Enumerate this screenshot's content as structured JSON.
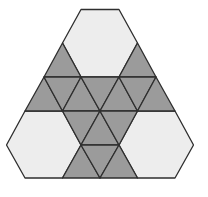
{
  "figure": {
    "colors": {
      "background": "#ffffff",
      "light_fill": "#ededed",
      "dark_fill": "#9b9b9b",
      "stroke": "#2e2e2e"
    },
    "stroke_width": 1.3,
    "hexagons": [
      {
        "name": "top-hexagon",
        "points": "81,9.5 119,9.5 137.5,43 119,77 81,77 62.5,43"
      },
      {
        "name": "left-hexagon",
        "points": "25,111 62.5,111 81,145 62.5,178 25,178 6.5,145"
      },
      {
        "name": "right-hexagon",
        "points": "137.5,111 175,111 193.5,145 175,178 137.5,178 119,145"
      }
    ],
    "triangles": [
      {
        "name": "triangle-top-left",
        "points": "62.5,43 81,77 44,77"
      },
      {
        "name": "triangle-top-right",
        "points": "137.5,43 156,77 119,77"
      },
      {
        "name": "triangle-r2-1",
        "points": "44,77 62.5,111 25,111"
      },
      {
        "name": "triangle-r2-2",
        "points": "44,77 81,77 62.5,111"
      },
      {
        "name": "triangle-r2-3",
        "points": "81,77 100,111 62.5,111"
      },
      {
        "name": "triangle-r2-4",
        "points": "81,77 119,77 100,111"
      },
      {
        "name": "triangle-r2-5",
        "points": "119,77 137.5,111 100,111"
      },
      {
        "name": "triangle-r2-6",
        "points": "119,77 156,77 137.5,111"
      },
      {
        "name": "triangle-r2-7",
        "points": "156,77 175,111 137.5,111"
      },
      {
        "name": "triangle-r3-1",
        "points": "62.5,111 100,111 81,145"
      },
      {
        "name": "triangle-r3-2",
        "points": "100,111 119,145 81,145"
      },
      {
        "name": "triangle-r3-3",
        "points": "100,111 137.5,111 119,145"
      },
      {
        "name": "triangle-r4-1",
        "points": "81,145 100,178 62.5,178"
      },
      {
        "name": "triangle-r4-2",
        "points": "81,145 119,145 100,178"
      },
      {
        "name": "triangle-r4-3",
        "points": "119,145 137.5,178 100,178"
      }
    ]
  }
}
